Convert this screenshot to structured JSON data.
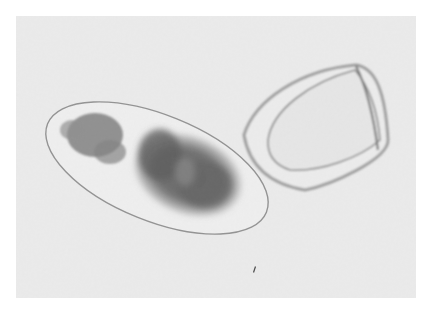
{
  "image": {
    "kind": "grayscale micrograph",
    "background_color": "#ebebeb",
    "page_color": "#ffffff",
    "objects": [
      {
        "name": "elongated-oval-egg",
        "description": "thin-walled oval shell containing dark granular mass",
        "fill_tone": "#6e6e6e"
      },
      {
        "name": "triangular-empty-shell",
        "description": "rounded triangular shell with thick double wall, empty interior",
        "wall_tone": "#8a8a8a"
      },
      {
        "name": "small-debris-speck",
        "description": "tiny dark particle near bottom center"
      }
    ]
  }
}
